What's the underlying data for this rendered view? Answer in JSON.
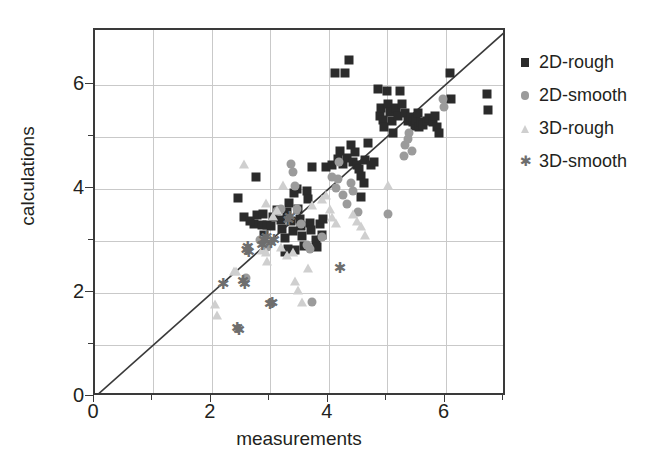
{
  "chart_data": {
    "type": "scatter",
    "title": "",
    "xlabel": "measurements",
    "ylabel": "calculations",
    "xlim": [
      0,
      7.05
    ],
    "ylim": [
      0,
      7.05
    ],
    "xticks": [
      0,
      2,
      4,
      6
    ],
    "yticks": [
      0,
      2,
      4,
      6
    ],
    "xticklabels": [
      "0",
      "2",
      "4",
      "6"
    ],
    "yticklabels": [
      "0",
      "2",
      "4",
      "6"
    ],
    "x_gridlines": [
      1,
      2,
      3,
      4,
      5,
      6,
      7
    ],
    "y_gridlines": [
      1,
      2,
      3,
      4,
      5,
      6
    ],
    "grid": true,
    "legend_position": "right",
    "reference_line": {
      "name": "identity-line",
      "from": [
        0,
        0
      ],
      "to": [
        7.05,
        7.05
      ],
      "color": "#3a3a3a"
    },
    "series": [
      {
        "name": "2D-rough",
        "marker": "square",
        "color": "#2b2b2b",
        "points": [
          [
            2.45,
            3.82
          ],
          [
            2.55,
            3.45
          ],
          [
            2.75,
            4.22
          ],
          [
            2.78,
            3.5
          ],
          [
            2.88,
            3.52
          ],
          [
            2.72,
            3.32
          ],
          [
            2.85,
            3.3
          ],
          [
            2.95,
            3.3
          ],
          [
            3.02,
            3.28
          ],
          [
            2.9,
            3.12
          ],
          [
            3.05,
            3.45
          ],
          [
            3.12,
            3.6
          ],
          [
            3.18,
            3.4
          ],
          [
            3.2,
            3.22
          ],
          [
            3.25,
            3.05
          ],
          [
            3.28,
            3.55
          ],
          [
            3.32,
            3.72
          ],
          [
            3.35,
            3.38
          ],
          [
            3.38,
            3.18
          ],
          [
            3.3,
            2.85
          ],
          [
            3.42,
            2.82
          ],
          [
            3.48,
            3.62
          ],
          [
            3.5,
            3.42
          ],
          [
            3.52,
            3.28
          ],
          [
            3.55,
            3.1
          ],
          [
            3.58,
            2.9
          ],
          [
            3.62,
            3.95
          ],
          [
            3.65,
            3.8
          ],
          [
            3.68,
            3.35
          ],
          [
            3.7,
            3.2
          ],
          [
            3.45,
            4.0
          ],
          [
            3.4,
            3.92
          ],
          [
            3.72,
            4.42
          ],
          [
            3.85,
            3.32
          ],
          [
            3.88,
            3.12
          ],
          [
            3.9,
            3.42
          ],
          [
            3.95,
            4.42
          ],
          [
            4.05,
            4.45
          ],
          [
            4.1,
            6.22
          ],
          [
            4.28,
            6.22
          ],
          [
            4.35,
            6.48
          ],
          [
            4.15,
            4.58
          ],
          [
            4.2,
            4.72
          ],
          [
            4.25,
            4.48
          ],
          [
            4.32,
            4.6
          ],
          [
            4.38,
            4.85
          ],
          [
            4.42,
            4.52
          ],
          [
            4.45,
            4.7
          ],
          [
            4.48,
            4.45
          ],
          [
            4.52,
            4.38
          ],
          [
            4.55,
            3.85
          ],
          [
            4.62,
            4.55
          ],
          [
            4.68,
            4.88
          ],
          [
            4.72,
            4.45
          ],
          [
            4.78,
            4.52
          ],
          [
            4.85,
            5.92
          ],
          [
            4.88,
            5.4
          ],
          [
            4.9,
            5.55
          ],
          [
            4.92,
            5.32
          ],
          [
            4.95,
            5.18
          ],
          [
            5.0,
            5.88
          ],
          [
            5.02,
            5.62
          ],
          [
            5.05,
            5.48
          ],
          [
            5.08,
            5.3
          ],
          [
            5.1,
            5.08
          ],
          [
            5.15,
            5.55
          ],
          [
            5.18,
            5.4
          ],
          [
            5.22,
            5.88
          ],
          [
            5.25,
            5.62
          ],
          [
            5.3,
            5.45
          ],
          [
            5.35,
            5.3
          ],
          [
            5.4,
            5.38
          ],
          [
            5.45,
            5.28
          ],
          [
            5.48,
            5.2
          ],
          [
            5.5,
            5.32
          ],
          [
            5.52,
            5.45
          ],
          [
            5.55,
            5.18
          ],
          [
            5.58,
            5.28
          ],
          [
            5.62,
            5.22
          ],
          [
            5.68,
            5.3
          ],
          [
            5.72,
            5.35
          ],
          [
            5.78,
            5.28
          ],
          [
            5.82,
            5.4
          ],
          [
            5.85,
            5.18
          ],
          [
            5.88,
            5.08
          ],
          [
            6.08,
            6.22
          ],
          [
            6.1,
            5.72
          ],
          [
            6.7,
            5.82
          ],
          [
            6.72,
            5.52
          ],
          [
            4.55,
            4.25
          ],
          [
            4.6,
            4.12
          ],
          [
            3.78,
            3.02
          ],
          [
            3.8,
            2.88
          ],
          [
            3.25,
            2.78
          ],
          [
            2.65,
            3.38
          ]
        ]
      },
      {
        "name": "2D-smooth",
        "marker": "circle",
        "color": "#9b9b9b",
        "points": [
          [
            2.58,
            2.28
          ],
          [
            2.82,
            3.02
          ],
          [
            2.88,
            2.98
          ],
          [
            3.12,
            3.58
          ],
          [
            3.18,
            3.62
          ],
          [
            3.35,
            4.48
          ],
          [
            3.38,
            4.32
          ],
          [
            3.42,
            4.05
          ],
          [
            3.45,
            3.62
          ],
          [
            3.62,
            2.92
          ],
          [
            3.68,
            2.85
          ],
          [
            3.72,
            1.82
          ],
          [
            3.88,
            3.08
          ],
          [
            4.05,
            4.22
          ],
          [
            4.12,
            4.02
          ],
          [
            4.15,
            4.18
          ],
          [
            4.25,
            3.88
          ],
          [
            4.32,
            3.7
          ],
          [
            4.38,
            4.12
          ],
          [
            4.42,
            3.95
          ],
          [
            4.5,
            3.55
          ],
          [
            5.02,
            3.52
          ],
          [
            5.28,
            4.62
          ],
          [
            5.3,
            4.85
          ],
          [
            5.35,
            4.95
          ],
          [
            5.38,
            5.08
          ],
          [
            5.42,
            4.72
          ],
          [
            5.95,
            5.72
          ],
          [
            5.98,
            5.58
          ],
          [
            3.52,
            3.32
          ],
          [
            2.95,
            2.88
          ],
          [
            4.18,
            4.52
          ]
        ]
      },
      {
        "name": "3D-rough",
        "marker": "triangle",
        "color": "#cfcfcf",
        "points": [
          [
            2.05,
            1.78
          ],
          [
            2.08,
            1.58
          ],
          [
            2.38,
            2.42
          ],
          [
            2.42,
            2.42
          ],
          [
            2.85,
            2.82
          ],
          [
            2.92,
            2.78
          ],
          [
            2.95,
            2.62
          ],
          [
            3.05,
            3.48
          ],
          [
            3.12,
            3.6
          ],
          [
            3.22,
            4.08
          ],
          [
            3.28,
            2.72
          ],
          [
            3.38,
            2.78
          ],
          [
            2.55,
            4.48
          ],
          [
            2.92,
            3.72
          ],
          [
            3.55,
            1.82
          ],
          [
            3.42,
            2.22
          ],
          [
            3.48,
            2.05
          ],
          [
            3.72,
            3.68
          ],
          [
            3.88,
            3.8
          ],
          [
            3.95,
            3.88
          ],
          [
            4.02,
            3.62
          ],
          [
            4.05,
            3.45
          ],
          [
            4.12,
            3.35
          ],
          [
            4.42,
            3.52
          ],
          [
            4.48,
            3.38
          ],
          [
            4.55,
            3.28
          ],
          [
            4.62,
            3.12
          ],
          [
            5.02,
            4.08
          ],
          [
            3.65,
            2.48
          ],
          [
            3.18,
            2.88
          ]
        ]
      },
      {
        "name": "3D-smooth",
        "marker": "star",
        "color": "#6e6e6e",
        "points": [
          [
            2.18,
            2.18
          ],
          [
            2.52,
            2.22
          ],
          [
            2.55,
            2.18
          ],
          [
            2.42,
            1.32
          ],
          [
            2.45,
            1.28
          ],
          [
            2.58,
            2.82
          ],
          [
            2.6,
            2.88
          ],
          [
            2.62,
            2.78
          ],
          [
            2.88,
            3.02
          ],
          [
            2.92,
            3.08
          ],
          [
            3.0,
            2.95
          ],
          [
            2.98,
            1.78
          ],
          [
            3.02,
            1.8
          ],
          [
            3.3,
            3.4
          ],
          [
            3.32,
            3.45
          ],
          [
            4.18,
            2.48
          ],
          [
            2.85,
            2.92
          ],
          [
            3.05,
            3.02
          ]
        ]
      }
    ]
  },
  "legend": {
    "items": [
      {
        "label": "2D-rough",
        "marker": "square",
        "color": "#2b2b2b"
      },
      {
        "label": "2D-smooth",
        "marker": "circle",
        "color": "#9b9b9b"
      },
      {
        "label": "3D-rough",
        "marker": "triangle",
        "color": "#cfcfcf"
      },
      {
        "label": "3D-smooth",
        "marker": "star",
        "color": "#6e6e6e"
      }
    ]
  },
  "axes": {
    "x_title": "measurements",
    "y_title": "calculations"
  },
  "colors": {
    "axis": "#3a3a3a",
    "grid": "#c9c9c9",
    "text": "#231f20",
    "background": "#ffffff"
  }
}
